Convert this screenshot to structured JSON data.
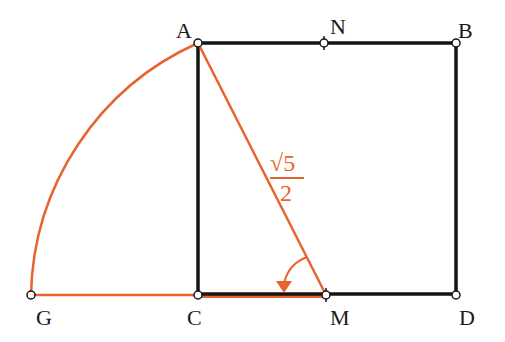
{
  "colors": {
    "black": "#141414",
    "orange": "#e8642e",
    "background": "#ffffff"
  },
  "points": {
    "A": {
      "label": "A",
      "x": 198,
      "y": 43
    },
    "N": {
      "label": "N",
      "x": 324,
      "y": 43
    },
    "B": {
      "label": "B",
      "x": 456,
      "y": 43
    },
    "C": {
      "label": "C",
      "x": 198,
      "y": 295
    },
    "M": {
      "label": "M",
      "x": 326,
      "y": 295
    },
    "D": {
      "label": "D",
      "x": 456,
      "y": 295
    },
    "G": {
      "label": "G",
      "x": 31,
      "y": 295
    }
  },
  "annotation": {
    "numerator": "√5",
    "denominator": "2"
  }
}
